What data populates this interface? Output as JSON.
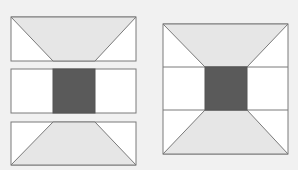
{
  "diagram": {
    "colors": {
      "background": "#f1f1f1",
      "panel": "#ffffff",
      "trapezoid": "#e6e6e6",
      "center": "#5a5a5a",
      "stroke": "#7a7a7a"
    },
    "left_pieces": [
      {
        "name": "top-strip",
        "x": 11,
        "y": 17,
        "w": 125,
        "h": 44,
        "trapezoid": [
          [
            11,
            17
          ],
          [
            136,
            17
          ],
          [
            95,
            61
          ],
          [
            53,
            61
          ]
        ]
      },
      {
        "name": "middle-strip",
        "x": 11,
        "y": 69,
        "w": 125,
        "h": 44,
        "center": {
          "x": 53,
          "y": 69,
          "w": 42,
          "h": 44
        }
      },
      {
        "name": "bottom-strip",
        "x": 11,
        "y": 122,
        "w": 125,
        "h": 43,
        "trapezoid": [
          [
            53,
            122
          ],
          [
            95,
            122
          ],
          [
            136,
            165
          ],
          [
            11,
            165
          ]
        ]
      }
    ],
    "right_square": {
      "x": 163,
      "y": 24,
      "w": 125,
      "h": 130,
      "h_lines": [
        67,
        110
      ],
      "center": {
        "x": 205,
        "y": 67,
        "w": 42,
        "h": 43
      },
      "top_trapezoid": [
        [
          163,
          24
        ],
        [
          288,
          24
        ],
        [
          247,
          67
        ],
        [
          205,
          67
        ]
      ],
      "bottom_trapezoid": [
        [
          205,
          110
        ],
        [
          247,
          110
        ],
        [
          288,
          154
        ],
        [
          163,
          154
        ]
      ]
    }
  }
}
